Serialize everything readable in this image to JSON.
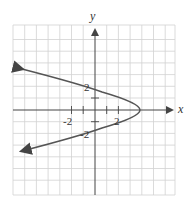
{
  "figure": {
    "type": "graph-of-relation",
    "equation_hint": "x = 4 - y^2",
    "axes": {
      "x_label": "x",
      "y_label": "y",
      "x_tick_labels": [
        "-2",
        "2"
      ],
      "y_tick_labels": [
        "2",
        "-2"
      ]
    },
    "grid": {
      "on": true,
      "color": "#cfcfcf",
      "columns": 14,
      "rows": 14
    },
    "curve": {
      "vertex": [
        4,
        0
      ],
      "y_intercepts": [
        2,
        -2
      ],
      "color": "#555555",
      "arrows": "both-ends-left"
    }
  }
}
